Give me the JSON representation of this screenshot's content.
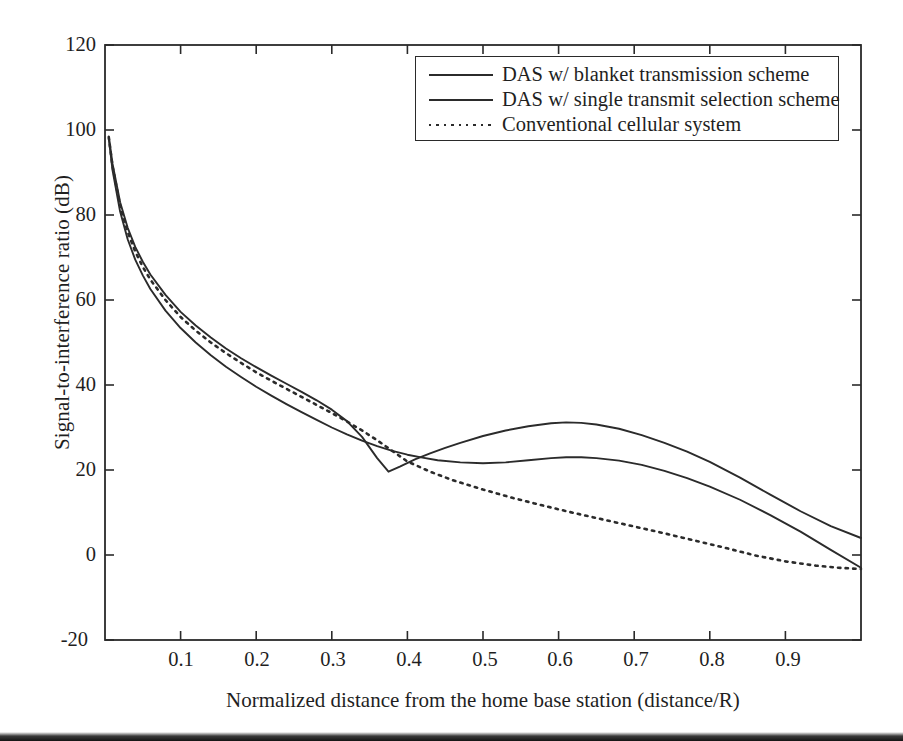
{
  "chart_data": {
    "type": "line",
    "title": "",
    "xlabel": "Normalized distance from the home base station (distance/R)",
    "ylabel": "Signal-to-interference ratio (dB)",
    "xlim": [
      0,
      1
    ],
    "ylim": [
      -20,
      120
    ],
    "xticks": [
      "0.1",
      "0.2",
      "0.3",
      "0.4",
      "0.5",
      "0.6",
      "0.7",
      "0.8",
      "0.9"
    ],
    "xtick_values": [
      0.1,
      0.2,
      0.3,
      0.4,
      0.5,
      0.6,
      0.7,
      0.8,
      0.9
    ],
    "yticks": [
      "120",
      "100",
      "80",
      "60",
      "40",
      "20",
      "0",
      "-20"
    ],
    "ytick_values": [
      120,
      100,
      80,
      60,
      40,
      20,
      0,
      -20
    ],
    "grid": false,
    "legend_position": "top-right",
    "series": [
      {
        "name": "DAS w/ blanket transmission scheme",
        "style": "solid",
        "color": "#2b2b2b",
        "x": [
          0.005,
          0.01,
          0.02,
          0.03,
          0.04,
          0.05,
          0.06,
          0.08,
          0.1,
          0.12,
          0.14,
          0.16,
          0.18,
          0.2,
          0.22,
          0.24,
          0.26,
          0.28,
          0.3,
          0.32,
          0.34,
          0.36,
          0.375,
          0.39,
          0.41,
          0.43,
          0.45,
          0.47,
          0.5,
          0.53,
          0.56,
          0.59,
          0.61,
          0.63,
          0.65,
          0.68,
          0.71,
          0.74,
          0.77,
          0.8,
          0.84,
          0.88,
          0.92,
          0.96,
          1.0
        ],
        "y": [
          98.5,
          92.0,
          83.0,
          77.0,
          72.5,
          69.0,
          66.0,
          61.2,
          57.2,
          54.0,
          51.2,
          48.6,
          46.3,
          44.2,
          42.2,
          40.3,
          38.4,
          36.4,
          34.2,
          31.5,
          27.8,
          22.8,
          19.6,
          20.8,
          22.5,
          23.9,
          25.2,
          26.4,
          28.0,
          29.3,
          30.3,
          31.0,
          31.2,
          31.1,
          30.7,
          29.7,
          28.2,
          26.4,
          24.3,
          21.9,
          18.2,
          14.2,
          10.3,
          6.8,
          4.0
        ]
      },
      {
        "name": "DAS w/ single transmit selection scheme",
        "style": "solid",
        "color": "#2b2b2b",
        "x": [
          0.005,
          0.01,
          0.02,
          0.03,
          0.04,
          0.05,
          0.06,
          0.08,
          0.1,
          0.12,
          0.14,
          0.16,
          0.18,
          0.2,
          0.22,
          0.24,
          0.26,
          0.28,
          0.3,
          0.32,
          0.34,
          0.36,
          0.38,
          0.4,
          0.42,
          0.44,
          0.47,
          0.5,
          0.53,
          0.56,
          0.59,
          0.61,
          0.63,
          0.65,
          0.68,
          0.71,
          0.74,
          0.77,
          0.8,
          0.84,
          0.88,
          0.92,
          0.96,
          1.0
        ],
        "y": [
          98.0,
          90.5,
          80.8,
          74.3,
          69.5,
          65.8,
          62.6,
          57.5,
          53.4,
          50.0,
          47.0,
          44.3,
          41.9,
          39.6,
          37.5,
          35.5,
          33.6,
          31.8,
          30.0,
          28.4,
          26.9,
          25.6,
          24.5,
          23.6,
          22.9,
          22.3,
          21.8,
          21.6,
          21.8,
          22.3,
          22.8,
          23.0,
          23.0,
          22.8,
          22.2,
          21.2,
          19.8,
          18.1,
          16.1,
          13.0,
          9.4,
          5.5,
          1.2,
          -3.0
        ]
      },
      {
        "name": "Conventional cellular system",
        "style": "dotted",
        "color": "#2b2b2b",
        "x": [
          0.005,
          0.01,
          0.02,
          0.03,
          0.04,
          0.05,
          0.06,
          0.08,
          0.1,
          0.12,
          0.14,
          0.16,
          0.18,
          0.2,
          0.22,
          0.24,
          0.26,
          0.28,
          0.3,
          0.32,
          0.34,
          0.36,
          0.38,
          0.4,
          0.43,
          0.46,
          0.5,
          0.54,
          0.58,
          0.62,
          0.66,
          0.7,
          0.74,
          0.78,
          0.82,
          0.86,
          0.9,
          0.94,
          0.97,
          1.0
        ],
        "y": [
          98.3,
          91.4,
          82.2,
          76.0,
          71.4,
          67.8,
          64.8,
          60.0,
          56.0,
          52.8,
          50.0,
          47.5,
          45.2,
          43.0,
          41.0,
          39.1,
          37.2,
          35.3,
          33.4,
          31.4,
          29.3,
          27.0,
          24.5,
          22.0,
          19.6,
          17.6,
          15.4,
          13.4,
          11.6,
          9.9,
          8.3,
          6.7,
          5.1,
          3.4,
          1.7,
          -0.1,
          -1.5,
          -2.5,
          -3.0,
          -3.3
        ]
      }
    ],
    "legend_entries": [
      {
        "label": "DAS w/ blanket transmission scheme",
        "style": "solid"
      },
      {
        "label": "DAS w/ single transmit selection scheme",
        "style": "solid"
      },
      {
        "label": "Conventional cellular system",
        "style": "dotted"
      }
    ]
  }
}
